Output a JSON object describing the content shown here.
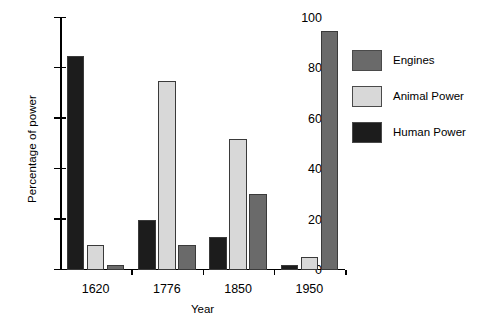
{
  "chart_data": {
    "type": "bar",
    "title": "",
    "xlabel": "Year",
    "ylabel": "Percentage of power",
    "categories": [
      "1620",
      "1776",
      "1850",
      "1950"
    ],
    "series": [
      {
        "name": "Human Power",
        "color": "#1c1c1c",
        "values": [
          85,
          20,
          13,
          2
        ]
      },
      {
        "name": "Animal Power",
        "color": "#d8d8d8",
        "values": [
          10,
          75,
          52,
          5
        ]
      },
      {
        "name": "Engines",
        "color": "#6a6a6a",
        "values": [
          2,
          10,
          30,
          95
        ]
      }
    ],
    "legend_order": [
      "Engines",
      "Animal Power",
      "Human Power"
    ],
    "ylim": [
      0,
      100
    ],
    "yticks": [
      0,
      20,
      40,
      60,
      80,
      100
    ],
    "ytick_labels": [
      "0",
      "20",
      "40",
      "60",
      "80",
      "100"
    ],
    "grid": false,
    "legend_position": "right",
    "bar_order_in_group": [
      "Human Power",
      "Animal Power",
      "Engines"
    ]
  },
  "legend": {
    "items": [
      {
        "label": "Engines",
        "color": "#6a6a6a"
      },
      {
        "label": "Animal Power",
        "color": "#d8d8d8"
      },
      {
        "label": "Human Power",
        "color": "#1c1c1c"
      }
    ]
  }
}
